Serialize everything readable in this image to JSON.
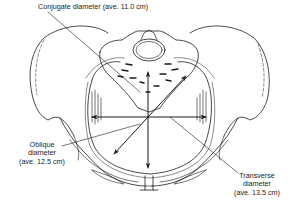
{
  "figure": {
    "labels": {
      "conjugate": {
        "line1": "Conjugate diameter (ave. 11.0 cm)"
      },
      "oblique": {
        "line1": "Oblique",
        "line2": "diameter",
        "line3": "(ave. 12.5 cm)"
      },
      "transverse": {
        "line1": "Transverse",
        "line2": "diameter",
        "line3": "(ave. 13.5 cm)"
      }
    },
    "measurements": [
      {
        "name": "Conjugate diameter",
        "average_cm": 11.0
      },
      {
        "name": "Oblique diameter",
        "average_cm": 12.5
      },
      {
        "name": "Transverse diameter",
        "average_cm": 13.5
      }
    ],
    "colors": {
      "ink": "#1a1a1a",
      "background": "#ffffff"
    }
  }
}
